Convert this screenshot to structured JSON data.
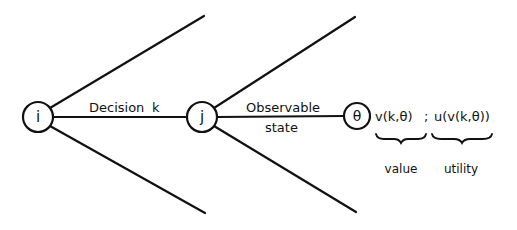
{
  "diagram": {
    "type": "decision-tree",
    "nodes": [
      {
        "id": "i",
        "label": "i",
        "cx": 38,
        "cy": 117,
        "r": 15
      },
      {
        "id": "j",
        "label": "j",
        "cx": 202,
        "cy": 117,
        "r": 15
      },
      {
        "id": "theta",
        "label": "θ",
        "cx": 357,
        "cy": 116,
        "r": 13
      }
    ],
    "edges": {
      "decision_label": "Decision",
      "decision_var": "k",
      "state_label_line1": "Observable",
      "state_label_line2": "state"
    },
    "formula": {
      "value_expr": "v(k,θ)",
      "separator": ";",
      "utility_expr": "u(v(k,θ))"
    },
    "captions": {
      "value": "value",
      "utility": "utility"
    },
    "colors": {
      "stroke": "#111111",
      "background": "#ffffff"
    }
  }
}
